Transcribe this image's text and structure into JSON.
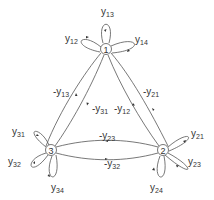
{
  "diagram": {
    "type": "signal-flow-graph",
    "nodes": [
      {
        "id": "1",
        "label": "1",
        "x": 106,
        "y": 49
      },
      {
        "id": "2",
        "label": "2",
        "x": 163,
        "y": 150
      },
      {
        "id": "3",
        "label": "3",
        "x": 51,
        "y": 150
      }
    ],
    "self_loops": [
      {
        "node": "1",
        "var": "y",
        "sub": "12"
      },
      {
        "node": "1",
        "var": "y",
        "sub": "13"
      },
      {
        "node": "1",
        "var": "y",
        "sub": "14"
      },
      {
        "node": "2",
        "var": "y",
        "sub": "21"
      },
      {
        "node": "2",
        "var": "y",
        "sub": "23"
      },
      {
        "node": "2",
        "var": "y",
        "sub": "24"
      },
      {
        "node": "3",
        "var": "y",
        "sub": "31"
      },
      {
        "node": "3",
        "var": "y",
        "sub": "32"
      },
      {
        "node": "3",
        "var": "y",
        "sub": "34"
      }
    ],
    "edges": [
      {
        "from": "3",
        "to": "1",
        "var": "-y",
        "sub": "13"
      },
      {
        "from": "1",
        "to": "3",
        "var": "-y",
        "sub": "31"
      },
      {
        "from": "2",
        "to": "1",
        "var": "-y",
        "sub": "12"
      },
      {
        "from": "1",
        "to": "2",
        "var": "-y",
        "sub": "21"
      },
      {
        "from": "2",
        "to": "3",
        "var": "-y",
        "sub": "23"
      },
      {
        "from": "3",
        "to": "2",
        "var": "-y",
        "sub": "32"
      }
    ]
  },
  "labels": {
    "n1": "1",
    "n2": "2",
    "n3": "3",
    "y12": {
      "v": "y",
      "s": "12"
    },
    "y13": {
      "v": "y",
      "s": "13"
    },
    "y14": {
      "v": "y",
      "s": "14"
    },
    "y21": {
      "v": "y",
      "s": "21"
    },
    "y23": {
      "v": "y",
      "s": "23"
    },
    "y24": {
      "v": "y",
      "s": "24"
    },
    "y31": {
      "v": "y",
      "s": "31"
    },
    "y32": {
      "v": "y",
      "s": "32"
    },
    "y34": {
      "v": "y",
      "s": "34"
    },
    "e13": {
      "v": "-y",
      "s": "13"
    },
    "e31": {
      "v": "-y",
      "s": "31"
    },
    "e12": {
      "v": "-y",
      "s": "12"
    },
    "e21": {
      "v": "-y",
      "s": "21"
    },
    "e23": {
      "v": "-y",
      "s": "23"
    },
    "e32": {
      "v": "-y",
      "s": "32"
    }
  }
}
